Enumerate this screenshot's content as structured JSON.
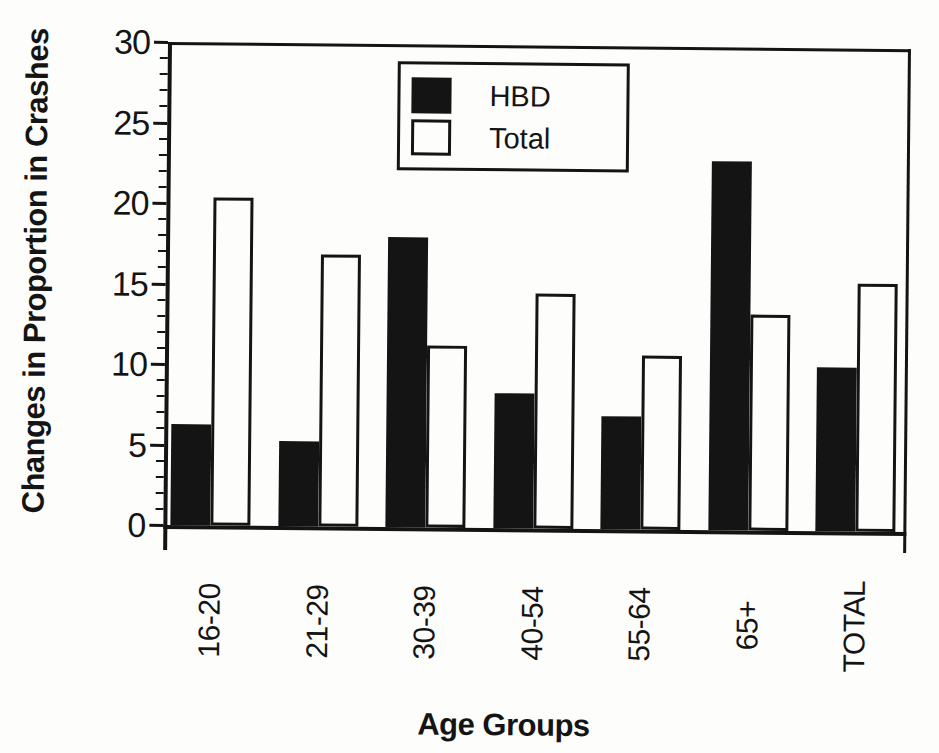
{
  "chart_data": {
    "type": "bar",
    "title": "",
    "xlabel": "Age Groups",
    "ylabel": "Changes in Proportion in Crashes",
    "categories": [
      "16-20",
      "21-29",
      "30-39",
      "40-54",
      "55-64",
      "65+",
      "TOTAL"
    ],
    "series": [
      {
        "name": "HBD",
        "style": "solid-black",
        "values": [
          6.3,
          5.3,
          18.0,
          8.4,
          7.0,
          22.9,
          10.2
        ]
      },
      {
        "name": "Total",
        "style": "white-outlined",
        "values": [
          20.4,
          16.9,
          11.3,
          14.6,
          10.8,
          13.4,
          15.4
        ]
      }
    ],
    "ylim": [
      0,
      30
    ],
    "y_major_ticks": [
      0,
      5,
      10,
      15,
      20,
      25,
      30
    ],
    "y_minor_tick_interval": 1,
    "grid": false,
    "legend_position": "inside-top-center"
  },
  "colors": {
    "ink": "#141414",
    "background": "#fdfdfb",
    "hbd_bar": "#141414",
    "total_bar": "#fdfdfb"
  }
}
